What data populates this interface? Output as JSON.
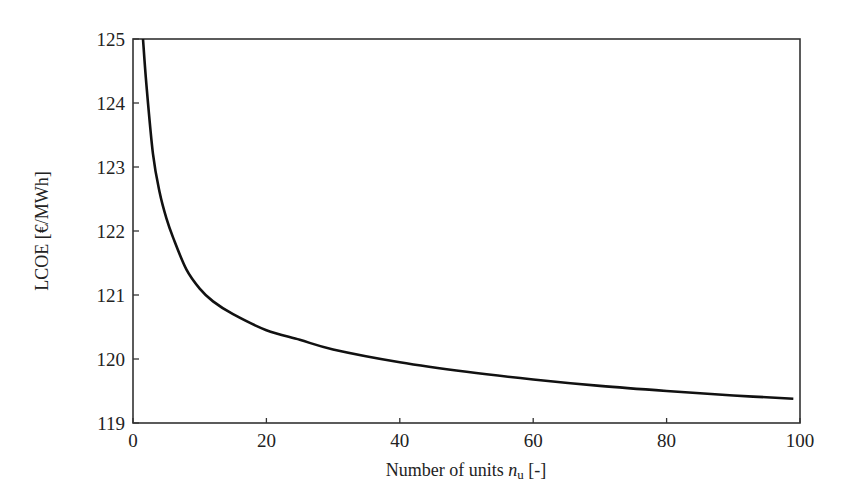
{
  "chart_data": {
    "type": "line",
    "title": "",
    "xlabel": "Number of units n_u [-]",
    "xlabel_parts": {
      "prefix": "Number of units ",
      "var": "n",
      "sub": "u",
      "suffix": " [-]"
    },
    "ylabel": "LCOE [€/MWh]",
    "xlim": [
      0,
      100
    ],
    "ylim": [
      119,
      125
    ],
    "xticks": [
      0,
      20,
      40,
      60,
      80,
      100
    ],
    "yticks": [
      119,
      120,
      121,
      122,
      123,
      124,
      125
    ],
    "grid": false,
    "legend": null,
    "series": [
      {
        "name": "LCOE",
        "color": "#111111",
        "x": [
          1.5,
          2,
          3,
          4,
          5,
          6,
          8,
          10,
          12,
          15,
          20,
          25,
          30,
          40,
          50,
          60,
          70,
          80,
          90,
          99
        ],
        "y": [
          125.0,
          124.3,
          123.2,
          122.6,
          122.2,
          121.9,
          121.4,
          121.1,
          120.9,
          120.7,
          120.45,
          120.3,
          120.15,
          119.95,
          119.8,
          119.68,
          119.58,
          119.5,
          119.43,
          119.38
        ]
      }
    ]
  }
}
